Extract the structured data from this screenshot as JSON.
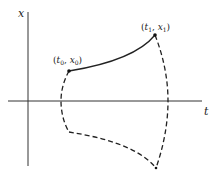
{
  "diagram": {
    "axes": {
      "vertical_label": "x",
      "horizontal_label": "t"
    },
    "points": [
      {
        "id": "start",
        "label_t": "t",
        "label_t_sub": "0",
        "label_x": "x",
        "label_x_sub": "0"
      },
      {
        "id": "end",
        "label_t": "t",
        "label_t_sub": "1",
        "label_x": "x",
        "label_x_sub": "1"
      }
    ],
    "curves": {
      "solid": "trajectory from (t0, x0) to (t1, x1)",
      "dashed": "boundary of admissible region"
    },
    "colors": {
      "line": "#222222",
      "background": "#ffffff"
    }
  }
}
